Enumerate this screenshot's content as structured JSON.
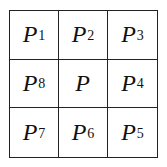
{
  "diagram": {
    "type": "3x3 pixel neighborhood",
    "cells": [
      {
        "symbol": "P",
        "subscript": "1"
      },
      {
        "symbol": "P",
        "subscript": "2"
      },
      {
        "symbol": "P",
        "subscript": "3"
      },
      {
        "symbol": "P",
        "subscript": "8"
      },
      {
        "symbol": "P",
        "subscript": ""
      },
      {
        "symbol": "P",
        "subscript": "4"
      },
      {
        "symbol": "P",
        "subscript": "7"
      },
      {
        "symbol": "P",
        "subscript": "6"
      },
      {
        "symbol": "P",
        "subscript": "5"
      }
    ],
    "line_color": "#222222"
  }
}
